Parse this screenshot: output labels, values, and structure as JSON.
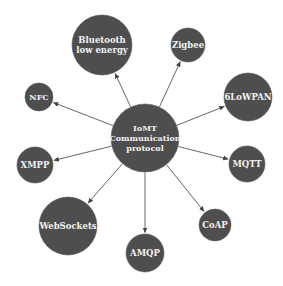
{
  "diagram": {
    "type": "hub-and-spoke",
    "colors": {
      "node_fill": "#4e4e4e",
      "label": "#f2f2f2",
      "edge": "#555555",
      "background": "#ffffff"
    },
    "center": {
      "id": "iomt",
      "lines": [
        "IoMT",
        "Communication",
        "protocol"
      ],
      "cx": 145,
      "cy": 138,
      "r": 34
    },
    "nodes": [
      {
        "id": "ble",
        "lines": [
          "Bluetooth",
          "low energy"
        ],
        "cx": 102,
        "cy": 45,
        "r": 30,
        "font": 8.5
      },
      {
        "id": "zigbee",
        "lines": [
          "Zigbee"
        ],
        "cx": 188,
        "cy": 45,
        "r": 17,
        "font": 8.5
      },
      {
        "id": "nfc",
        "lines": [
          "NFC"
        ],
        "cx": 39,
        "cy": 97,
        "r": 14,
        "font": 8
      },
      {
        "id": "6lowpan",
        "lines": [
          "6LoWPAN"
        ],
        "cx": 248,
        "cy": 97,
        "r": 24,
        "font": 8.5
      },
      {
        "id": "xmpp",
        "lines": [
          "XMPP"
        ],
        "cx": 35,
        "cy": 165,
        "r": 18,
        "font": 8.5
      },
      {
        "id": "mqtt",
        "lines": [
          "MQTT"
        ],
        "cx": 247,
        "cy": 164,
        "r": 18,
        "font": 8.5
      },
      {
        "id": "websockets",
        "lines": [
          "WebSockets"
        ],
        "cx": 68,
        "cy": 226,
        "r": 29,
        "font": 8.5
      },
      {
        "id": "amqp",
        "lines": [
          "AMQP"
        ],
        "cx": 145,
        "cy": 253,
        "r": 19,
        "font": 8.5
      },
      {
        "id": "coap",
        "lines": [
          "CoAP"
        ],
        "cx": 215,
        "cy": 225,
        "r": 16,
        "font": 8.5
      }
    ]
  }
}
